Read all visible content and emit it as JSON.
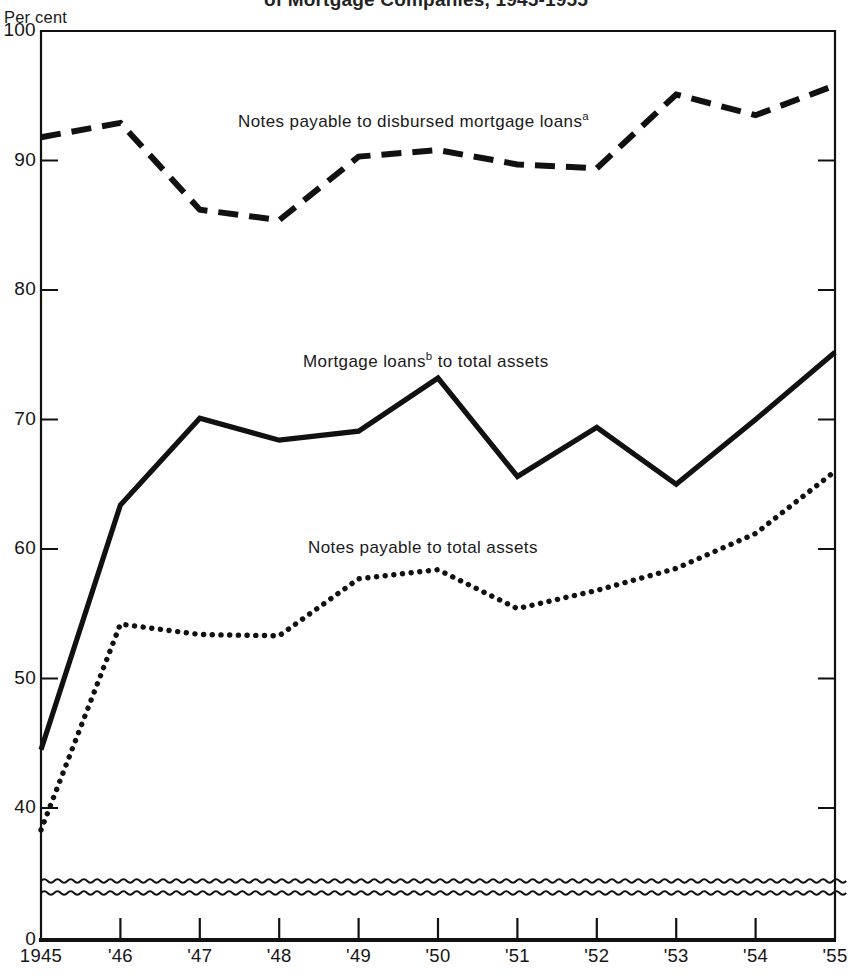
{
  "title": "of Mortgage Companies, 1945-1955",
  "axis_unit": "Per cent",
  "y_ticks": [
    "100",
    "90",
    "80",
    "70",
    "60",
    "50",
    "40",
    "0"
  ],
  "x_ticks": [
    "1945",
    "'46",
    "'47",
    "'48",
    "'49",
    "'50",
    "'51",
    "'52",
    "'53",
    "'54",
    "'55"
  ],
  "series_labels": {
    "dashed": "Notes payable to disbursed mortgage loans",
    "dashed_sup": "a",
    "solid_pre": "Mortgage loans",
    "solid_sup": "b",
    "solid_post": " to total assets",
    "dotted": "Notes payable to total assets"
  },
  "colors": {
    "line": "#111111",
    "axis": "#1a1a1a",
    "background": "#ffffff"
  },
  "chart_data": {
    "type": "line",
    "title": "of Mortgage Companies, 1945-1955",
    "xlabel": "",
    "ylabel": "Per cent",
    "ylim": [
      40,
      100
    ],
    "y_break_below": 40,
    "grid": false,
    "legend": "inline-annotations",
    "categories": [
      "1945",
      "1946",
      "1947",
      "1948",
      "1949",
      "1950",
      "1951",
      "1952",
      "1953",
      "1954",
      "1955"
    ],
    "series": [
      {
        "name": "Notes payable to disbursed mortgage loans",
        "style": "dashed",
        "values": [
          91.8,
          92.9,
          86.2,
          85.4,
          90.3,
          90.8,
          89.7,
          89.4,
          95.1,
          93.5,
          95.8
        ]
      },
      {
        "name": "Mortgage loans to total assets",
        "style": "solid",
        "values": [
          44.5,
          63.4,
          70.1,
          68.4,
          69.1,
          73.2,
          65.6,
          69.4,
          65.0,
          70.0,
          75.2
        ]
      },
      {
        "name": "Notes payable to total assets",
        "style": "dotted",
        "values": [
          38.3,
          54.2,
          53.4,
          53.3,
          57.7,
          58.4,
          55.4,
          56.8,
          58.5,
          61.2,
          66.0
        ]
      }
    ]
  }
}
